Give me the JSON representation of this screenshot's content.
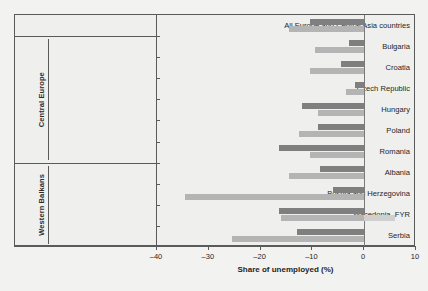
{
  "chart_data": {
    "type": "bar",
    "orientation": "horizontal",
    "title": "",
    "xlabel": "Share of unemployed (%)",
    "ylabel": "",
    "xlim": [
      -40,
      10
    ],
    "xticks": [
      -40,
      -30,
      -20,
      -10,
      0,
      10
    ],
    "xticklabels": [
      "–40",
      "–30",
      "–20",
      "–10",
      "0",
      "10"
    ],
    "grid": false,
    "legend": "none",
    "zero_reference_line": 0,
    "groups": [
      {
        "name": "",
        "categories": [
          "All Europe and Central Asia countries"
        ]
      },
      {
        "name": "Central Europe",
        "categories": [
          "Bulgaria",
          "Croatia",
          "Czech Republic",
          "Hungary",
          "Poland",
          "Romania"
        ]
      },
      {
        "name": "Western Balkans",
        "categories": [
          "Albania",
          "Bosnia and Herzegovina",
          "Macedonia, FYR",
          "Serbia"
        ]
      }
    ],
    "categories": [
      "All Europe and Central Asia countries",
      "Bulgaria",
      "Croatia",
      "Czech Republic",
      "Hungary",
      "Poland",
      "Romania",
      "Albania",
      "Bosnia and Herzegovina",
      "Macedonia, FYR",
      "Serbia"
    ],
    "series": [
      {
        "name": "series-1",
        "color": "#7f7f7f",
        "values": [
          -10.5,
          -3.0,
          -4.5,
          -1.8,
          -12.0,
          -9.0,
          -16.5,
          -8.5,
          -6.0,
          -16.5,
          -13.0
        ]
      },
      {
        "name": "series-2",
        "color": "#b4b4b4",
        "values": [
          -14.5,
          -9.5,
          -10.5,
          -3.5,
          -9.0,
          -12.5,
          -10.5,
          -14.5,
          -34.5,
          -16.0,
          -25.5
        ]
      }
    ],
    "extra_bars": [
      {
        "category": "Macedonia, FYR",
        "value": 6.0,
        "color": "#cfcfcf",
        "note": "positive-side bar"
      }
    ]
  },
  "axis": {
    "x_title": "Share of unemployed (%)"
  }
}
